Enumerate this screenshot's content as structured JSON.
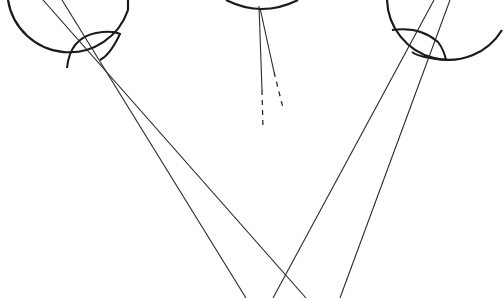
{
  "diagram": {
    "colors": {
      "stroke": "#1a1a1a",
      "background": "#ffffff"
    },
    "eyes": [
      {
        "name": "left-eye",
        "cx": 66,
        "cy": 6,
        "r": 62
      },
      {
        "name": "center-eye",
        "cx": 262,
        "cy": -28,
        "r": 38
      },
      {
        "name": "right-eye",
        "cx": 443,
        "cy": 0,
        "r": 62
      }
    ]
  }
}
